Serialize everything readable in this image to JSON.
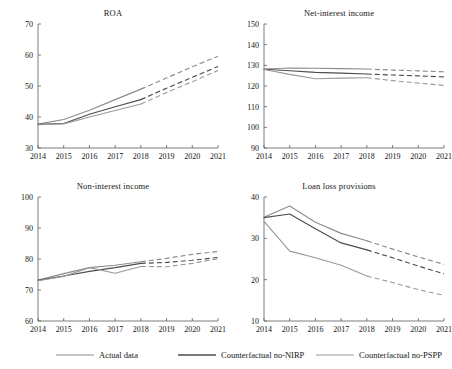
{
  "figure": {
    "width": 452,
    "height": 369,
    "background": "#ffffff",
    "panel_count": 4
  },
  "legend": {
    "position": "bottom",
    "entries": [
      {
        "label": "Actual data",
        "color": "#8c8c8c",
        "style": "solid",
        "width": 1.1
      },
      {
        "label": "Counterfactual no-NIRP",
        "color": "#4d4d4d",
        "style": "solid",
        "width": 1.3
      },
      {
        "label": "Counterfactual no-PSPP",
        "color": "#9a9a9a",
        "style": "solid",
        "width": 1.1
      }
    ]
  },
  "chart_data": [
    {
      "id": "roa",
      "type": "line",
      "title": "ROA",
      "xlabel": "",
      "ylabel": "",
      "x": [
        "2014",
        "2015",
        "2016",
        "2017",
        "2018",
        "2019",
        "2020",
        "2021"
      ],
      "xlim": [
        2014,
        2021
      ],
      "ylim": [
        30,
        70
      ],
      "yticks": [
        30,
        40,
        50,
        60,
        70
      ],
      "grid": false,
      "forecast_start": "2018",
      "series": [
        {
          "name": "Actual data",
          "color": "#8c8c8c",
          "values": [
            37.7,
            39.2,
            42.2,
            45.6,
            49.0,
            52.6,
            56.2,
            59.6
          ],
          "solid_through": 4
        },
        {
          "name": "Counterfactual no-NIRP",
          "color": "#4d4d4d",
          "values": [
            37.6,
            37.9,
            40.9,
            43.3,
            45.6,
            49.3,
            52.8,
            56.3
          ],
          "solid_through": 4
        },
        {
          "name": "Counterfactual no-PSPP",
          "color": "#9a9a9a",
          "values": [
            37.5,
            37.8,
            40.0,
            42.1,
            44.2,
            47.9,
            51.4,
            55.0
          ],
          "solid_through": 4
        }
      ]
    },
    {
      "id": "net-interest-income",
      "type": "line",
      "title": "Net-interest income",
      "xlabel": "",
      "ylabel": "",
      "x": [
        "2014",
        "2015",
        "2016",
        "2017",
        "2018",
        "2019",
        "2020",
        "2021"
      ],
      "xlim": [
        2014,
        2021
      ],
      "ylim": [
        90,
        150
      ],
      "yticks": [
        90,
        100,
        110,
        120,
        130,
        140,
        150
      ],
      "grid": false,
      "forecast_start": "2018",
      "series": [
        {
          "name": "Actual data",
          "color": "#8c8c8c",
          "values": [
            128.2,
            128.7,
            128.6,
            128.4,
            128.2,
            127.7,
            127.3,
            126.9
          ],
          "solid_through": 4
        },
        {
          "name": "Counterfactual no-NIRP",
          "color": "#4d4d4d",
          "values": [
            128.1,
            127.4,
            126.6,
            126.2,
            125.8,
            125.3,
            124.9,
            124.4
          ],
          "solid_through": 4
        },
        {
          "name": "Counterfactual no-PSPP",
          "color": "#9a9a9a",
          "values": [
            128.0,
            125.6,
            123.5,
            123.8,
            124.0,
            122.6,
            121.4,
            120.3
          ],
          "solid_through": 4
        }
      ]
    },
    {
      "id": "non-interest-income",
      "type": "line",
      "title": "Non-interest income",
      "xlabel": "",
      "ylabel": "",
      "x": [
        "2014",
        "2015",
        "2016",
        "2017",
        "2018",
        "2019",
        "2020",
        "2021"
      ],
      "xlim": [
        2014,
        2021
      ],
      "ylim": [
        60,
        100
      ],
      "yticks": [
        60,
        70,
        80,
        90,
        100
      ],
      "grid": false,
      "forecast_start": "2018",
      "series": [
        {
          "name": "Actual data",
          "color": "#8c8c8c",
          "values": [
            73.2,
            75.3,
            77.2,
            78.0,
            79.1,
            80.2,
            81.5,
            82.4
          ],
          "solid_through": 4
        },
        {
          "name": "Counterfactual no-NIRP",
          "color": "#4d4d4d",
          "values": [
            73.1,
            74.5,
            76.0,
            77.2,
            78.6,
            78.9,
            79.6,
            80.5
          ],
          "solid_through": 4
        },
        {
          "name": "Counterfactual no-PSPP",
          "color": "#9a9a9a",
          "values": [
            73.0,
            74.4,
            77.2,
            75.4,
            77.6,
            77.5,
            78.6,
            80.1
          ],
          "solid_through": 4
        }
      ]
    },
    {
      "id": "loan-loss-provisions",
      "type": "line",
      "title": "Loan loss provisions",
      "xlabel": "",
      "ylabel": "",
      "x": [
        "2014",
        "2015",
        "2016",
        "2017",
        "2018",
        "2019",
        "2020",
        "2021"
      ],
      "xlim": [
        2014,
        2021
      ],
      "ylim": [
        10,
        40
      ],
      "yticks": [
        10,
        20,
        30,
        40
      ],
      "grid": false,
      "forecast_start": "2018",
      "series": [
        {
          "name": "Actual data",
          "color": "#8c8c8c",
          "values": [
            35.1,
            37.8,
            33.9,
            31.2,
            29.4,
            27.4,
            25.5,
            23.7
          ],
          "solid_through": 4
        },
        {
          "name": "Counterfactual no-NIRP",
          "color": "#4d4d4d",
          "values": [
            35.0,
            35.9,
            32.3,
            28.9,
            27.2,
            25.3,
            23.3,
            21.4
          ],
          "solid_through": 4
        },
        {
          "name": "Counterfactual no-PSPP",
          "color": "#9a9a9a",
          "values": [
            34.1,
            26.9,
            25.3,
            23.5,
            20.9,
            19.3,
            17.6,
            16.2
          ],
          "solid_through": 4
        }
      ]
    }
  ]
}
